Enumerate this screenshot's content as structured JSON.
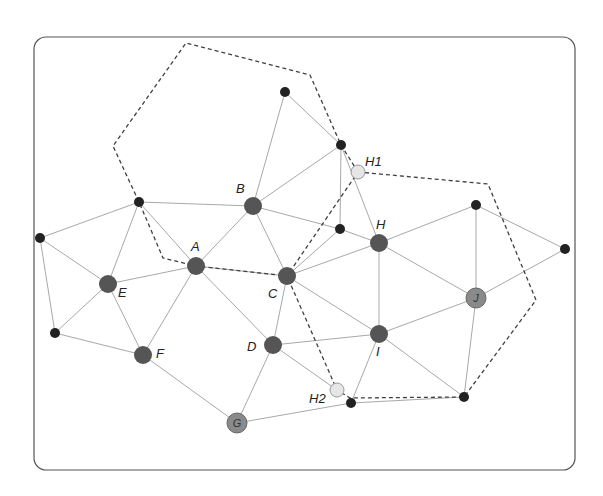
{
  "diagram": {
    "title": "",
    "frame": {
      "x": 34,
      "y": 37,
      "w": 541,
      "h": 433,
      "r": 12,
      "stroke": "#555555"
    },
    "colors": {
      "large_node": "#555555",
      "light_large_node": "#8a8a8a",
      "small_node": "#222222",
      "virtual_node": "#e6e6e6",
      "edge": "#a8a8a8",
      "dashed": "#404040"
    },
    "nodes": [
      {
        "id": "A",
        "label": "A",
        "x": 196,
        "y": 266,
        "kind": "large",
        "lx": 191,
        "ly": 251
      },
      {
        "id": "B",
        "label": "B",
        "x": 253,
        "y": 206,
        "kind": "large",
        "lx": 236,
        "ly": 193
      },
      {
        "id": "C",
        "label": "C",
        "x": 287,
        "y": 276,
        "kind": "large",
        "lx": 268,
        "ly": 298
      },
      {
        "id": "D",
        "label": "D",
        "x": 273,
        "y": 345,
        "kind": "large",
        "lx": 247,
        "ly": 351
      },
      {
        "id": "E",
        "label": "E",
        "x": 108,
        "y": 284,
        "kind": "large",
        "lx": 118,
        "ly": 297
      },
      {
        "id": "F",
        "label": "F",
        "x": 143,
        "y": 355,
        "kind": "large",
        "lx": 156,
        "ly": 358
      },
      {
        "id": "G",
        "label": "G",
        "x": 237,
        "y": 423,
        "kind": "light-inside"
      },
      {
        "id": "H",
        "label": "H",
        "x": 379,
        "y": 243,
        "kind": "large",
        "lx": 376,
        "ly": 229
      },
      {
        "id": "I",
        "label": "I",
        "x": 379,
        "y": 334,
        "kind": "large",
        "lx": 376,
        "ly": 356
      },
      {
        "id": "J",
        "label": "J",
        "x": 476,
        "y": 298,
        "kind": "light-inside"
      },
      {
        "id": "H1",
        "label": "H1",
        "x": 358,
        "y": 172,
        "kind": "virtual",
        "lx": 365,
        "ly": 166
      },
      {
        "id": "H2",
        "label": "H2",
        "x": 337,
        "y": 390,
        "kind": "virtual",
        "lx": 309,
        "ly": 403
      },
      {
        "id": "s1",
        "label": "",
        "x": 285,
        "y": 92,
        "kind": "small"
      },
      {
        "id": "s2",
        "label": "",
        "x": 341,
        "y": 145,
        "kind": "small"
      },
      {
        "id": "s3",
        "label": "",
        "x": 139,
        "y": 202,
        "kind": "small"
      },
      {
        "id": "s4",
        "label": "",
        "x": 40,
        "y": 238,
        "kind": "small"
      },
      {
        "id": "s5",
        "label": "",
        "x": 55,
        "y": 333,
        "kind": "small"
      },
      {
        "id": "s6",
        "label": "",
        "x": 340,
        "y": 229,
        "kind": "small"
      },
      {
        "id": "s7",
        "label": "",
        "x": 476,
        "y": 205,
        "kind": "small"
      },
      {
        "id": "s8",
        "label": "",
        "x": 565,
        "y": 249,
        "kind": "small"
      },
      {
        "id": "s9",
        "label": "",
        "x": 351,
        "y": 403,
        "kind": "small"
      },
      {
        "id": "s10",
        "label": "",
        "x": 464,
        "y": 397,
        "kind": "small"
      }
    ],
    "edges": [
      [
        "s4",
        "s3"
      ],
      [
        "s4",
        "E"
      ],
      [
        "s4",
        "s5"
      ],
      [
        "s3",
        "E"
      ],
      [
        "s3",
        "A"
      ],
      [
        "s3",
        "B"
      ],
      [
        "E",
        "A"
      ],
      [
        "E",
        "F"
      ],
      [
        "E",
        "s5"
      ],
      [
        "s5",
        "F"
      ],
      [
        "A",
        "F"
      ],
      [
        "A",
        "B"
      ],
      [
        "A",
        "D"
      ],
      [
        "A",
        "C"
      ],
      [
        "B",
        "s1"
      ],
      [
        "B",
        "s2"
      ],
      [
        "B",
        "C"
      ],
      [
        "B",
        "s6"
      ],
      [
        "s1",
        "s2"
      ],
      [
        "s2",
        "s6"
      ],
      [
        "s2",
        "H"
      ],
      [
        "s6",
        "H"
      ],
      [
        "C",
        "s6"
      ],
      [
        "C",
        "H"
      ],
      [
        "C",
        "I"
      ],
      [
        "C",
        "D"
      ],
      [
        "H",
        "s7"
      ],
      [
        "H",
        "J"
      ],
      [
        "H",
        "I"
      ],
      [
        "s7",
        "J"
      ],
      [
        "s7",
        "s8"
      ],
      [
        "J",
        "s8"
      ],
      [
        "J",
        "I"
      ],
      [
        "J",
        "s10"
      ],
      [
        "I",
        "D"
      ],
      [
        "I",
        "s9"
      ],
      [
        "I",
        "s10"
      ],
      [
        "D",
        "H2"
      ],
      [
        "D",
        "G"
      ],
      [
        "F",
        "G"
      ],
      [
        "G",
        "s9"
      ],
      [
        "s9",
        "s10"
      ]
    ],
    "dashed_paths": [
      {
        "name": "cell-top-left",
        "points": "358,172 341,145 310,75 186,43 113,146 139,202 163,258 196,266 287,276 358,172"
      },
      {
        "name": "cell-right",
        "points": "358,172 488,184 536,300 464,397 350,398 337,390 287,276"
      }
    ]
  }
}
